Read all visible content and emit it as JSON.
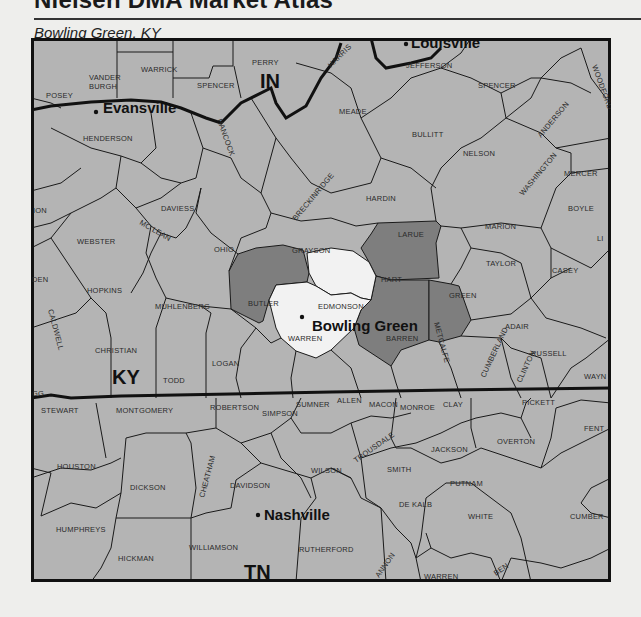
{
  "header": {
    "atlas_title": "Nielsen DMA Market Atlas",
    "market_name": "Bowling Green, KY"
  },
  "colors": {
    "page_background": "#eeeeec",
    "county_default": "#b4b4b4",
    "county_dma_secondary": "#7e7e7e",
    "county_dma_primary": "#f2f2f2",
    "border": "#1a1a1a"
  },
  "states": {
    "indiana": "IN",
    "kentucky": "KY",
    "tennessee": "TN"
  },
  "cities": {
    "evansville": "Evansville",
    "louisville": "Louisville",
    "bowling_green": "Bowling Green",
    "nashville": "Nashville"
  },
  "dma_counties": {
    "primary": [
      "Warren",
      "Edmonson"
    ],
    "secondary": [
      "Butler",
      "Hart",
      "Barren",
      "Metcalfe"
    ]
  },
  "counties": {
    "posey": "POSEY",
    "vanderburgh_1": "VANDER",
    "vanderburgh_2": "BURGH",
    "warrick": "WARRICK",
    "spencer_in": "SPENCER",
    "perry": "PERRY",
    "harrison": "HARRIS",
    "jefferson": "JEFFERSON",
    "woodford": "WOODFORD",
    "henderson": "HENDERSON",
    "hancock": "HANCOCK",
    "meade": "MEADE",
    "bullitt": "BULLITT",
    "spencer_ky": "SPENCER",
    "anderson": "ANDERSON",
    "nelson": "NELSON",
    "mercer": "MERCER",
    "union": "ION",
    "daviess": "DAVIESS",
    "breckinridge": "BRECKINRIDGE",
    "hardin": "HARDIN",
    "washington": "WASHINGTON",
    "boyle": "BOYLE",
    "webster": "WEBSTER",
    "mclean": "MC LEAN",
    "ohio": "OHIO",
    "grayson": "GRAYSON",
    "larue": "LARUE",
    "marion": "MARION",
    "lincoln": "LI",
    "crittenden": "DEN",
    "hopkins": "HOPKINS",
    "taylor": "TAYLOR",
    "casey": "CASEY",
    "caldwell": "CALDWELL",
    "muhlenberg": "MUHLENBERG",
    "butler": "BUTLER",
    "edmonson": "EDMONSON",
    "hart": "HART",
    "green": "GREEN",
    "adair": "ADAIR",
    "christian": "CHRISTIAN",
    "warren": "WARREN",
    "barren": "BARREN",
    "metcalfe": "METCALFE",
    "russell": "RUSSELL",
    "trigg": "GG",
    "todd": "TODD",
    "logan": "LOGAN",
    "cumberland": "CUMBERLAND",
    "clinton": "CLINTON",
    "wayne": "WAYN",
    "simpson": "SIMPSON",
    "allen": "ALLEN",
    "monroe": "MONROE",
    "stewart": "STEWART",
    "montgomery": "MONTGOMERY",
    "robertson": "ROBERTSON",
    "sumner": "SUMNER",
    "macon": "MACON",
    "clay": "CLAY",
    "pickett": "PICKETT",
    "fentress": "FENT",
    "trousdale": "TROUSDALE",
    "jackson": "JACKSON",
    "overton": "OVERTON",
    "houston": "HOUSTON",
    "dickson": "DICKSON",
    "cheatham": "CHEATHAM",
    "davidson": "DAVIDSON",
    "wilson": "WILSON",
    "smith": "SMITH",
    "putnam": "PUTNAM",
    "humphreys": "HUMPHREYS",
    "dekalb": "DE KALB",
    "white": "WHITE",
    "cumberland_tn": "CUMBER",
    "williamson": "WILLIAMSON",
    "rutherford": "RUTHERFORD",
    "hickman": "HICKMAN",
    "cannon": "ANNON",
    "warren_tn": "WARREN",
    "van_buren": "BEN"
  }
}
